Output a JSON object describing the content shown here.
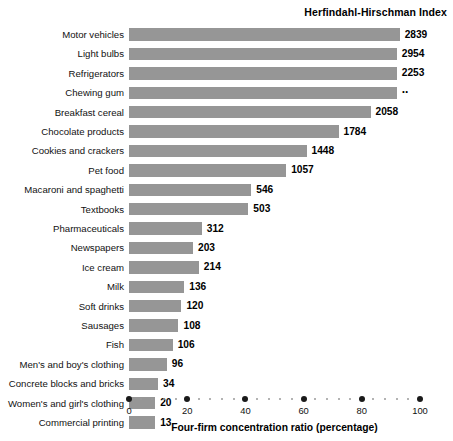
{
  "header": {
    "hhi_title": "Herfindahl-Hirschman Index"
  },
  "axis": {
    "title": "Four-firm concentration ratio (percentage)",
    "tick_labels": [
      "0",
      "20",
      "40",
      "60",
      "80",
      "100"
    ],
    "tick_values": [
      0,
      20,
      40,
      60,
      80,
      100
    ]
  },
  "chart_data": {
    "type": "bar",
    "orientation": "horizontal",
    "title": "",
    "xlabel": "Four-firm concentration ratio (percentage)",
    "ylabel": "",
    "xlim": [
      0,
      100
    ],
    "grid": false,
    "legend": null,
    "bar_color": "#969696",
    "categories": [
      "Motor vehicles",
      "Light bulbs",
      "Refrigerators",
      "Chewing gum",
      "Breakfast cereal",
      "Chocolate products",
      "Cookies and crackers",
      "Pet food",
      "Macaroni and spaghetti",
      "Textbooks",
      "Pharmaceuticals",
      "Newspapers",
      "Ice cream",
      "Milk",
      "Soft drinks",
      "Sausages",
      "Fish",
      "Men's and boy's clothing",
      "Concrete blocks and bricks",
      "Women's and girl's clothing",
      "Commercial printing"
    ],
    "series": [
      {
        "name": "Four-firm concentration ratio (percentage)",
        "values": [
          93,
          92,
          92,
          92,
          83,
          72,
          61,
          54,
          42,
          41,
          25,
          22,
          24,
          19,
          18,
          17,
          15,
          13,
          9,
          9,
          9
        ]
      },
      {
        "name": "Herfindahl-Hirschman Index",
        "values": [
          2839,
          2954,
          2253,
          null,
          2058,
          1784,
          1448,
          1057,
          546,
          503,
          312,
          203,
          214,
          136,
          120,
          108,
          106,
          96,
          34,
          20,
          13
        ]
      }
    ],
    "rows": [
      {
        "label": "Motor vehicles",
        "ratio": 93,
        "hhi": "2839"
      },
      {
        "label": "Light bulbs",
        "ratio": 92,
        "hhi": "2954"
      },
      {
        "label": "Refrigerators",
        "ratio": 92,
        "hhi": "2253"
      },
      {
        "label": "Chewing gum",
        "ratio": 92,
        "hhi": ".."
      },
      {
        "label": "Breakfast cereal",
        "ratio": 83,
        "hhi": "2058"
      },
      {
        "label": "Chocolate products",
        "ratio": 72,
        "hhi": "1784"
      },
      {
        "label": "Cookies and crackers",
        "ratio": 61,
        "hhi": "1448"
      },
      {
        "label": "Pet food",
        "ratio": 54,
        "hhi": "1057"
      },
      {
        "label": "Macaroni and spaghetti",
        "ratio": 42,
        "hhi": "546"
      },
      {
        "label": "Textbooks",
        "ratio": 41,
        "hhi": "503"
      },
      {
        "label": "Pharmaceuticals",
        "ratio": 25,
        "hhi": "312"
      },
      {
        "label": "Newspapers",
        "ratio": 22,
        "hhi": "203"
      },
      {
        "label": "Ice cream",
        "ratio": 24,
        "hhi": "214"
      },
      {
        "label": "Milk",
        "ratio": 19,
        "hhi": "136"
      },
      {
        "label": "Soft drinks",
        "ratio": 18,
        "hhi": "120"
      },
      {
        "label": "Sausages",
        "ratio": 17,
        "hhi": "108"
      },
      {
        "label": "Fish",
        "ratio": 15,
        "hhi": "106"
      },
      {
        "label": "Men's and boy's clothing",
        "ratio": 13,
        "hhi": "96"
      },
      {
        "label": "Concrete blocks and bricks",
        "ratio": 10,
        "hhi": "34"
      },
      {
        "label": "Women's and girl's clothing",
        "ratio": 9,
        "hhi": "20"
      },
      {
        "label": "Commercial printing",
        "ratio": 9,
        "hhi": "13"
      }
    ]
  }
}
